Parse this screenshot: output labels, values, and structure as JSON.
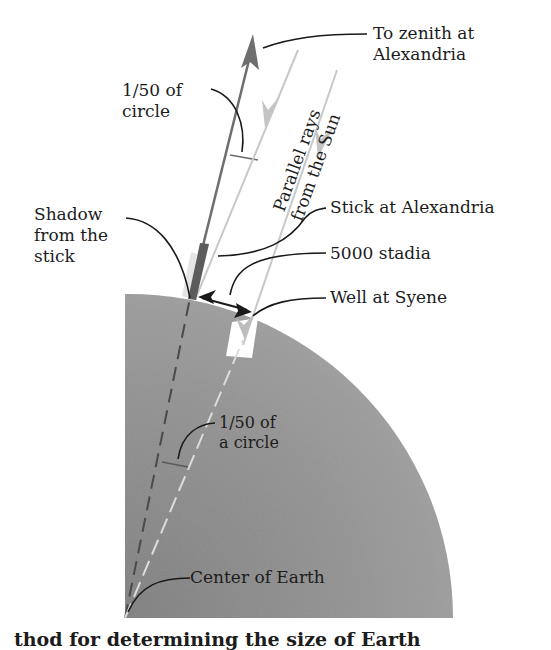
{
  "figure": {
    "labels": {
      "zenith_line1": "To zenith at",
      "zenith_line2": "Alexandria",
      "angle_top_line1": "1/50 of",
      "angle_top_line2": "circle",
      "rays_line1": "Parallel rays",
      "rays_line2": "from the Sun",
      "shadow_line1": "Shadow",
      "shadow_line2": "from the",
      "shadow_line3": "stick",
      "stick": "Stick at Alexandria",
      "distance": "5000 stadia",
      "well": "Well at Syene",
      "angle_center_line1": "1/50 of",
      "angle_center_line2": "a circle",
      "center": "Center of Earth"
    },
    "caption_partial": "thod for determining the size of Earth",
    "colors": {
      "earth_fill": "#8c8c8c",
      "earth_fill_light": "#a6a6a6",
      "ray_color": "#c4c4c4",
      "zenith_arrow": "#6e6e6e",
      "stick": "#5a5a5a",
      "leader_lines": "#1a1a1a",
      "background": "#ffffff"
    }
  }
}
